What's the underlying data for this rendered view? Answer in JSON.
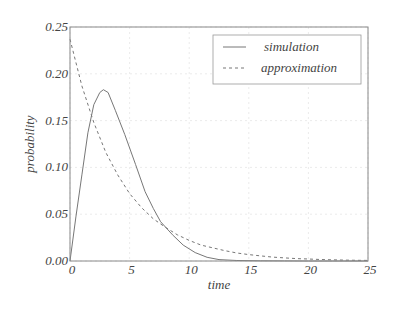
{
  "chart_data": {
    "type": "line",
    "title": "",
    "xlabel": "time",
    "ylabel": "probability",
    "xlim": [
      0,
      25
    ],
    "ylim": [
      0,
      0.25
    ],
    "xticks": [
      0,
      5,
      10,
      15,
      20,
      25
    ],
    "xtick_labels": [
      "0",
      "5",
      "10",
      "15",
      "20",
      "25"
    ],
    "yticks": [
      0.0,
      0.05,
      0.1,
      0.15,
      0.2,
      0.25
    ],
    "ytick_labels": [
      "0.00",
      "0.05",
      "0.10",
      "0.15",
      "0.20",
      "0.25"
    ],
    "grid": true,
    "legend_position": "upper right",
    "series": [
      {
        "name": "simulation",
        "style": "solid",
        "color": "#777777",
        "x": [
          0,
          0.5,
          1.0,
          1.5,
          2.0,
          2.5,
          2.8,
          3.2,
          3.8,
          4.6,
          5.5,
          6.3,
          7.0,
          7.6,
          8.6,
          9.5,
          10.5,
          11.5,
          12.5,
          14,
          16,
          18,
          20,
          22,
          25
        ],
        "y": [
          0.0,
          0.048,
          0.092,
          0.137,
          0.167,
          0.18,
          0.183,
          0.18,
          0.161,
          0.135,
          0.103,
          0.074,
          0.056,
          0.042,
          0.028,
          0.017,
          0.009,
          0.004,
          0.0015,
          0.0005,
          0.0002,
          0.0001,
          0.0,
          0.0,
          0.0
        ]
      },
      {
        "name": "approximation",
        "style": "dashed",
        "color": "#777777",
        "x": [
          0,
          1,
          2,
          3,
          4,
          5,
          6,
          7,
          8,
          9,
          10,
          11,
          12,
          13,
          14,
          15,
          16,
          17,
          18,
          19,
          20,
          21,
          22,
          23,
          24,
          25
        ],
        "y": [
          0.237,
          0.187,
          0.148,
          0.116,
          0.092,
          0.072,
          0.057,
          0.045,
          0.036,
          0.028,
          0.022,
          0.017,
          0.014,
          0.011,
          0.0086,
          0.0068,
          0.0054,
          0.0042,
          0.0033,
          0.0026,
          0.0021,
          0.0016,
          0.0013,
          0.001,
          0.0008,
          0.0006
        ]
      }
    ]
  },
  "layout": {
    "plot_left": 70,
    "plot_right": 368,
    "plot_top": 27,
    "plot_bottom": 261
  }
}
